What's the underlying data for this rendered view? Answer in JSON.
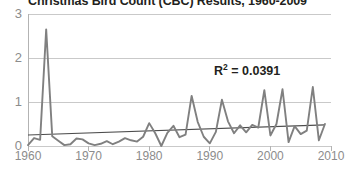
{
  "chart_data": {
    "type": "line",
    "title": "Christmas Bird Count (CBC) Results, 1960-2009",
    "xlabel": "",
    "ylabel": "",
    "xlim": [
      1960,
      2010
    ],
    "ylim": [
      0,
      3
    ],
    "grid": true,
    "legend": false,
    "y_ticks": [
      "0",
      "1",
      "2",
      "3"
    ],
    "y_tick_values": [
      0,
      1,
      2,
      3
    ],
    "x_ticks": [
      "1960",
      "1970",
      "1980",
      "1990",
      "2000",
      "2010"
    ],
    "x_tick_values": [
      1960,
      1970,
      1980,
      1990,
      2000,
      2010
    ],
    "annotations": [
      {
        "name": "r-squared",
        "text": "R",
        "superscript": "2",
        "suffix": " = 0.0391",
        "full_text": "R2 = 0.0391",
        "value": 0.0391
      }
    ],
    "series": [
      {
        "name": "CBC birds per party hour",
        "color": "#808080",
        "x": [
          1960,
          1961,
          1962,
          1963,
          1964,
          1965,
          1966,
          1967,
          1968,
          1969,
          1970,
          1971,
          1972,
          1973,
          1974,
          1975,
          1976,
          1977,
          1978,
          1979,
          1980,
          1981,
          1982,
          1983,
          1984,
          1985,
          1986,
          1987,
          1988,
          1989,
          1990,
          1991,
          1992,
          1993,
          1994,
          1995,
          1996,
          1997,
          1998,
          1999,
          2000,
          2001,
          2002,
          2003,
          2004,
          2005,
          2006,
          2007,
          2008,
          2009
        ],
        "values": [
          0.02,
          0.18,
          0.14,
          2.65,
          0.22,
          0.12,
          0.02,
          0.04,
          0.17,
          0.15,
          0.06,
          0.02,
          0.05,
          0.11,
          0.04,
          0.1,
          0.18,
          0.13,
          0.1,
          0.21,
          0.52,
          0.29,
          0.0,
          0.3,
          0.46,
          0.2,
          0.26,
          1.14,
          0.55,
          0.21,
          0.06,
          0.32,
          1.05,
          0.56,
          0.29,
          0.47,
          0.31,
          0.48,
          0.42,
          1.27,
          0.24,
          0.5,
          1.29,
          0.09,
          0.45,
          0.27,
          0.35,
          1.34,
          0.13,
          0.5
        ]
      }
    ],
    "trendline": {
      "name": "linear-trend",
      "color": "#4d4d4d",
      "x": [
        1960,
        2009
      ],
      "values": [
        0.25,
        0.48
      ]
    }
  }
}
